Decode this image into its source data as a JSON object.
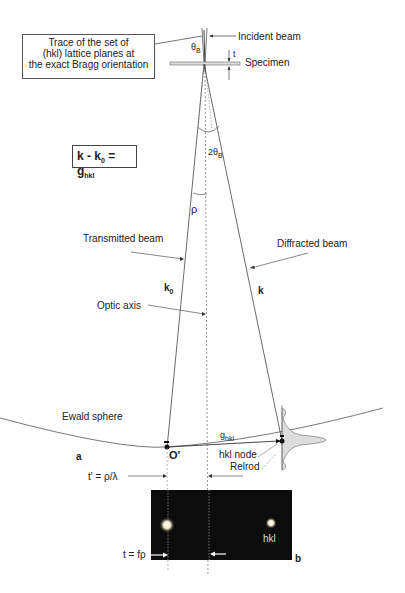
{
  "labels": {
    "trace_box": [
      "Trace of the set of",
      "(hkl) lattice planes at",
      "the exact Bragg orientation"
    ],
    "incident_beam": "Incident beam",
    "specimen": "Specimen",
    "thickness": "t",
    "theta_b": "θ",
    "theta_b_sub": "B",
    "two_theta_b": "2θ",
    "two_theta_b_sub": "B",
    "equation_k": "k - k",
    "equation_k0_sub": "0",
    "equation_eq": " = g",
    "equation_g_sub": "hkl",
    "rho": "ρ",
    "transmitted_beam": "Transmitted beam",
    "diffracted_beam": "Diffracted beam",
    "k0": "k",
    "k0_sub": "0",
    "k": "k",
    "optic_axis": "Optic axis",
    "ewald_sphere": "Ewald sphere",
    "g_hkl": "g",
    "g_hkl_sub": "hkl",
    "panel_a": "a",
    "origin": "O'",
    "hkl_node": "hkl node",
    "relrod": "Relrod",
    "t_prime": "t' = ρ/λ",
    "t_f_rho": "t = fρ",
    "spot_hkl": "hkl",
    "panel_b": "b"
  },
  "colors": {
    "line": "#444444",
    "panel_bg": "#0c0c0c",
    "relrod_fill": "#dcdcdc",
    "spot": "#ffffff"
  }
}
